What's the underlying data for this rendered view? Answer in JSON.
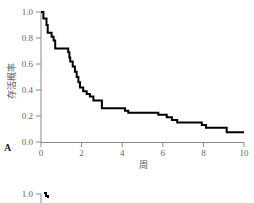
{
  "chart_data": {
    "type": "line",
    "subtype": "kaplan-meier-step",
    "panel_label": "A",
    "title": "",
    "xlabel": "周",
    "ylabel": "存活概率",
    "xlim": [
      0,
      10
    ],
    "ylim": [
      0,
      1.0
    ],
    "x_ticks": [
      0,
      2,
      4,
      6,
      8,
      10
    ],
    "y_ticks": [
      "0.0",
      "0.2",
      "0.4",
      "0.6",
      "0.8",
      "1.0"
    ],
    "grid": false,
    "legend": null,
    "series": [
      {
        "name": "survival",
        "color": "#000000",
        "points": [
          [
            0,
            1.0
          ],
          [
            0.12,
            0.95
          ],
          [
            0.27,
            0.9
          ],
          [
            0.33,
            0.84
          ],
          [
            0.52,
            0.81
          ],
          [
            0.62,
            0.78
          ],
          [
            0.7,
            0.72
          ],
          [
            1.34,
            0.69
          ],
          [
            1.4,
            0.65
          ],
          [
            1.44,
            0.62
          ],
          [
            1.56,
            0.58
          ],
          [
            1.67,
            0.54
          ],
          [
            1.76,
            0.5
          ],
          [
            1.84,
            0.46
          ],
          [
            1.92,
            0.42
          ],
          [
            2.08,
            0.39
          ],
          [
            2.25,
            0.37
          ],
          [
            2.41,
            0.35
          ],
          [
            2.58,
            0.32
          ],
          [
            3.0,
            0.26
          ],
          [
            4.14,
            0.24
          ],
          [
            4.3,
            0.225
          ],
          [
            5.78,
            0.21
          ],
          [
            6.19,
            0.19
          ],
          [
            6.45,
            0.17
          ],
          [
            6.71,
            0.15
          ],
          [
            7.92,
            0.13
          ],
          [
            8.13,
            0.11
          ],
          [
            9.15,
            0.075
          ]
        ],
        "end_x": 10
      }
    ],
    "second_panel_partial": {
      "y_tick_top": "1.0"
    }
  },
  "colors": {
    "axis": "#8a8a8a",
    "curve": "#000000",
    "text": "#666666"
  }
}
